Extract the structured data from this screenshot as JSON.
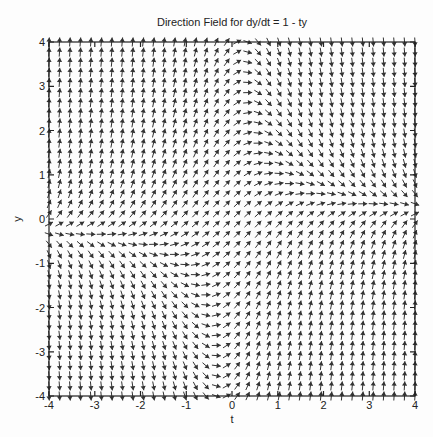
{
  "page": {
    "background_color": "#fdfdfd"
  },
  "chart_data": {
    "type": "line",
    "subtype": "direction_field",
    "title": "Direction Field for dy/dt = 1 - ty",
    "equation": "dy/dt = 1 - t*y",
    "xlabel": "t",
    "ylabel": "y",
    "xlim": [
      -4,
      4
    ],
    "ylim": [
      -4,
      4
    ],
    "x_ticks": [
      -4,
      -3,
      -2,
      -1,
      0,
      1,
      2,
      3,
      4
    ],
    "y_ticks": [
      -4,
      -3,
      -2,
      -1,
      0,
      1,
      2,
      3,
      4
    ],
    "grid_cols": 36,
    "grid_rows": 36,
    "arrow_length_px": 9,
    "arrow_head_px": 2.6,
    "arrow_color": "#333333",
    "axis_color": "#222222",
    "grid": "off",
    "legend": "none"
  }
}
